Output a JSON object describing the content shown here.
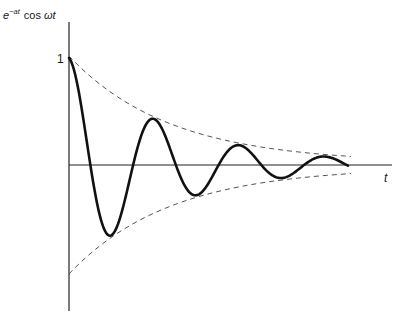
{
  "chart_data": {
    "type": "line",
    "title": "",
    "ylabel": "e^{-at} cos ωt",
    "ylabel_parts": {
      "base": "e",
      "sup": "−at",
      "rest": "cos ",
      "omega": "ω",
      "t": "t"
    },
    "xlabel": "t",
    "y_ticks": [
      {
        "value": 1,
        "label": "1"
      }
    ],
    "function": "e^{-at} cos(ωt)",
    "series": [
      {
        "name": "e^{-at} cos ωt",
        "style": "solid",
        "color": "#111111"
      },
      {
        "name": "e^{-at} (upper envelope)",
        "style": "dashed",
        "color": "#555555"
      },
      {
        "name": "-e^{-at} (lower envelope)",
        "style": "dashed",
        "color": "#555555"
      }
    ],
    "params": {
      "a": 0.0099,
      "omega": 0.0735,
      "amplitude_px": 107
    },
    "key_points": [
      {
        "label": "start",
        "t": 0,
        "y": 1.0
      },
      {
        "label": "trough 1",
        "t": 0.5,
        "y": -0.66
      },
      {
        "label": "peak 1",
        "t": 1.0,
        "y": 0.42
      },
      {
        "label": "trough 2",
        "t": 1.5,
        "y": -0.32
      },
      {
        "label": "peak 2",
        "t": 2.0,
        "y": 0.19
      },
      {
        "label": "trough 3",
        "t": 2.5,
        "y": -0.16
      },
      {
        "label": "peak 3",
        "t": 3.0,
        "y": 0.08
      }
    ],
    "grid": false,
    "legend": "none"
  },
  "labels": {
    "y_base": "e",
    "y_sup": "−at",
    "y_cos": "cos",
    "y_omega": "ω",
    "y_t": "t",
    "x_axis": "t",
    "one": "1"
  }
}
